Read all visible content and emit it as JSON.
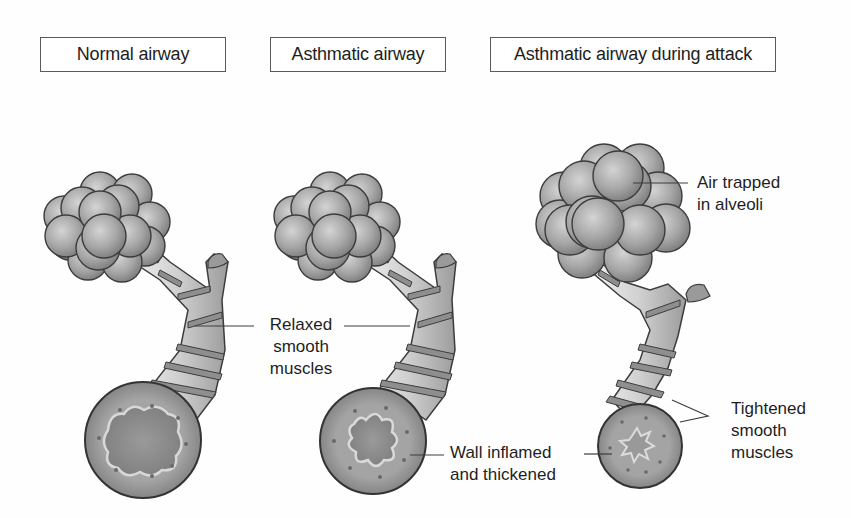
{
  "panels": [
    {
      "title": "Normal airway",
      "lumen": "open, regular wavy outline"
    },
    {
      "title": "Asthmatic airway",
      "lumen": "narrowed, star-shaped"
    },
    {
      "title": "Asthmatic airway during attack",
      "lumen": "severely constricted, small star-shaped"
    }
  ],
  "labels": {
    "relaxed": {
      "line1": "Relaxed",
      "line2": "smooth",
      "line3": "muscles"
    },
    "inflamed": {
      "line1": "Wall inflamed",
      "line2": "and thickened"
    },
    "trapped": {
      "line1": "Air trapped",
      "line2": "in alveoli"
    },
    "tightened": {
      "line1": "Tightened",
      "line2": "smooth",
      "line3": "muscles"
    }
  },
  "colors": {
    "outline": "#3c3c3c",
    "alveoli": "#a8a8a8",
    "airway": "#c4c4c4",
    "muscle_band": "#8a8a8a",
    "wall": "#9a9a9a",
    "lumen": "#8c8c8c"
  }
}
